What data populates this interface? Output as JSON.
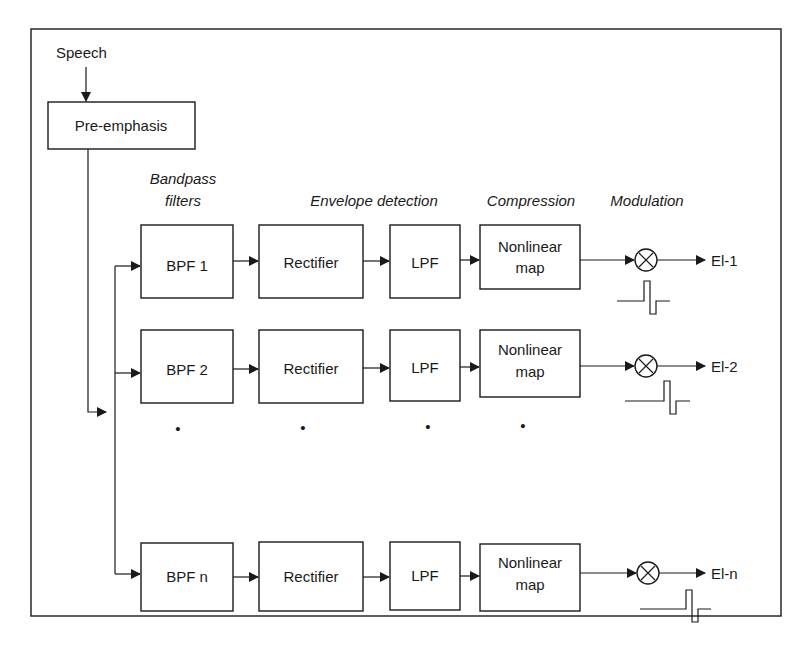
{
  "diagram": {
    "input_label": "Speech",
    "preemphasis_label": "Pre-emphasis",
    "stage_headers": {
      "bandpass_line1": "Bandpass",
      "bandpass_line2": "filters",
      "envelope": "Envelope detection",
      "compression": "Compression",
      "modulation": "Modulation"
    },
    "channels": [
      {
        "bpf": "BPF 1",
        "rect": "Rectifier",
        "lpf": "LPF",
        "map1": "Nonlinear",
        "map2": "map",
        "out": "El-1"
      },
      {
        "bpf": "BPF 2",
        "rect": "Rectifier",
        "lpf": "LPF",
        "map1": "Nonlinear",
        "map2": "map",
        "out": "El-2"
      },
      {
        "bpf": "BPF n",
        "rect": "Rectifier",
        "lpf": "LPF",
        "map1": "Nonlinear",
        "map2": "map",
        "out": "El-n"
      }
    ],
    "ellipsis": "•"
  }
}
